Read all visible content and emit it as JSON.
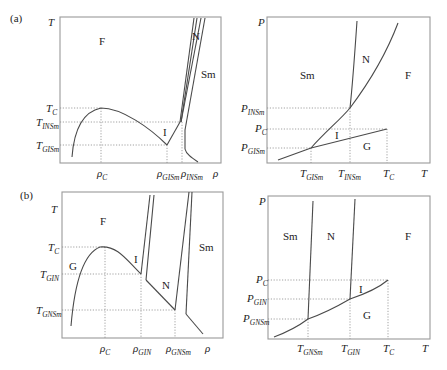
{
  "panels": {
    "a": {
      "tag": "(a)",
      "left": {
        "y_axis": "T",
        "x_axis": "ρ",
        "regions": {
          "F": "F",
          "N": "N",
          "Sm": "Sm",
          "I": "I"
        },
        "y_ticks": [
          {
            "base": "T",
            "sub": "C"
          },
          {
            "base": "T",
            "sub": "INSm"
          },
          {
            "base": "T",
            "sub": "GISm"
          }
        ],
        "x_ticks": [
          {
            "base": "ρ",
            "sub": "C"
          },
          {
            "base": "ρ",
            "sub": "GISm"
          },
          {
            "base": "ρ",
            "sub": "INSm"
          }
        ]
      },
      "right": {
        "y_axis": "P",
        "x_axis": "T",
        "regions": {
          "Sm": "Sm",
          "N": "N",
          "F": "F",
          "I": "I",
          "G": "G"
        },
        "y_ticks": [
          {
            "base": "P",
            "sub": "INSm"
          },
          {
            "base": "P",
            "sub": "C"
          },
          {
            "base": "P",
            "sub": "GISm"
          }
        ],
        "x_ticks": [
          {
            "base": "T",
            "sub": "GISm"
          },
          {
            "base": "T",
            "sub": "INSm"
          },
          {
            "base": "T",
            "sub": "C"
          }
        ]
      }
    },
    "b": {
      "tag": "(b)",
      "left": {
        "y_axis": "T",
        "x_axis": "ρ",
        "regions": {
          "F": "F",
          "G": "G",
          "I": "I",
          "N": "N",
          "Sm": "Sm"
        },
        "y_ticks": [
          {
            "base": "T",
            "sub": "C"
          },
          {
            "base": "T",
            "sub": "GIN"
          },
          {
            "base": "T",
            "sub": "GNSm"
          }
        ],
        "x_ticks": [
          {
            "base": "ρ",
            "sub": "C"
          },
          {
            "base": "ρ",
            "sub": "GIN"
          },
          {
            "base": "ρ",
            "sub": "GNSm"
          }
        ]
      },
      "right": {
        "y_axis": "P",
        "x_axis": "T",
        "regions": {
          "Sm": "Sm",
          "N": "N",
          "F": "F",
          "I": "I",
          "G": "G"
        },
        "y_ticks": [
          {
            "base": "P",
            "sub": "C"
          },
          {
            "base": "P",
            "sub": "GIN"
          },
          {
            "base": "P",
            "sub": "GNSm"
          }
        ],
        "x_ticks": [
          {
            "base": "T",
            "sub": "GNSm"
          },
          {
            "base": "T",
            "sub": "GIN"
          },
          {
            "base": "T",
            "sub": "C"
          }
        ]
      }
    }
  }
}
